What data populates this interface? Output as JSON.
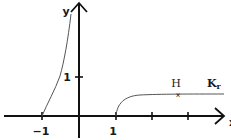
{
  "figure": {
    "type": "function-graph-sketch",
    "axes": {
      "x_label": "x",
      "y_label": "y",
      "x_ticks": [
        {
          "value": -1,
          "label": "−1"
        },
        {
          "value": 1,
          "label": "1"
        },
        {
          "value": 2,
          "label": ""
        },
        {
          "value": 3,
          "label": ""
        }
      ],
      "y_ticks": [
        {
          "value": 1,
          "label": "1"
        }
      ]
    },
    "curves": [
      {
        "name": "left-branch",
        "description": "rises steeply from (-1, 0) upward toward the y-axis"
      },
      {
        "name": "right-branch",
        "description": "starts at (1, 0), rises and levels off near y ≈ 0.6 as x increases"
      }
    ],
    "annotations": [
      {
        "text": "H",
        "description": "marked point on right branch"
      },
      {
        "text": "K",
        "subscript": "r",
        "description": "curve name label"
      }
    ],
    "colors": {
      "axis": "#111111",
      "curve": "#555555",
      "text": "#1a1a1a",
      "background": "#ffffff"
    }
  }
}
